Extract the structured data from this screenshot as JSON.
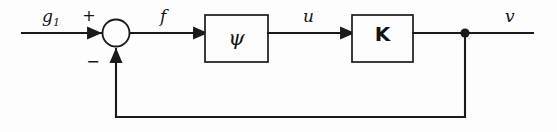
{
  "diagram": {
    "type": "control-system-block-diagram",
    "background_color": "#fdfdfd",
    "line_color": "#1a1a1a",
    "signals": {
      "input": "g",
      "input_subscript": "1",
      "error": "f",
      "control": "u",
      "output": "v"
    },
    "summing_junction": {
      "plus_sign": "+",
      "minus_sign": "−"
    },
    "blocks": [
      {
        "id": "psi",
        "label": "ψ"
      },
      {
        "id": "gain",
        "label": "K"
      }
    ],
    "icons": {
      "arrow": "arrowhead-icon",
      "node": "junction-dot-icon"
    }
  }
}
